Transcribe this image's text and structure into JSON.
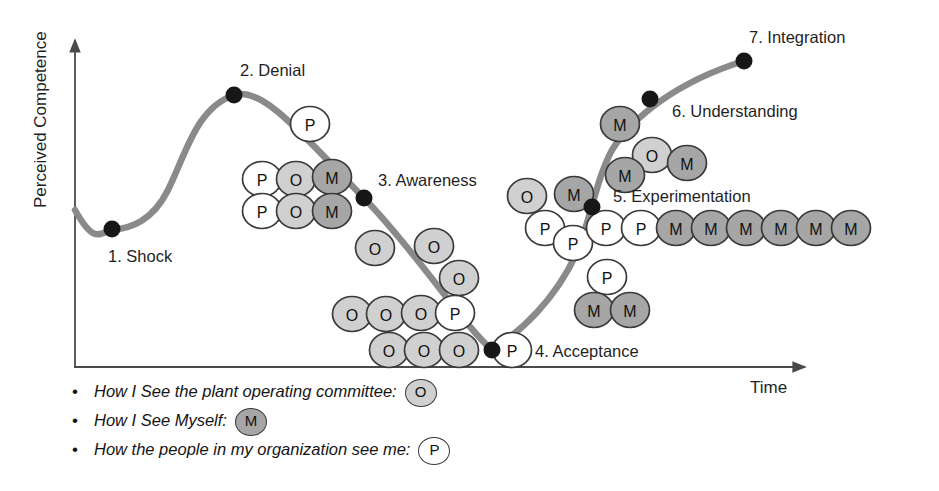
{
  "axes": {
    "y_label": "Perceived Competence",
    "x_label": "Time"
  },
  "stages": [
    {
      "id": 1,
      "label": "1. Shock",
      "dot": [
        112,
        229
      ],
      "text_x": 108,
      "text_y": 262,
      "anchor": "start"
    },
    {
      "id": 2,
      "label": "2. Denial",
      "dot": [
        234,
        95
      ],
      "text_x": 240,
      "text_y": 76,
      "anchor": "start"
    },
    {
      "id": 3,
      "label": "3. Awareness",
      "dot": [
        364,
        198
      ],
      "text_x": 378,
      "text_y": 186,
      "anchor": "start"
    },
    {
      "id": 4,
      "label": "4. Acceptance",
      "dot": [
        492,
        350
      ],
      "text_x": 535,
      "text_y": 357,
      "anchor": "start"
    },
    {
      "id": 5,
      "label": "5. Experimentation",
      "dot": [
        592,
        207
      ],
      "text_x": 613,
      "text_y": 202,
      "anchor": "start"
    },
    {
      "id": 6,
      "label": "6. Understanding",
      "dot": [
        650,
        99
      ],
      "text_x": 672,
      "text_y": 117,
      "anchor": "start"
    },
    {
      "id": 7,
      "label": "7. Integration",
      "dot": [
        744,
        61
      ],
      "text_x": 749,
      "text_y": 43,
      "anchor": "start"
    }
  ],
  "legend": [
    {
      "bullet": "•",
      "text": "How I See the plant operating committee:",
      "token": "O"
    },
    {
      "bullet": "•",
      "text": "How I See Myself:",
      "token": "M"
    },
    {
      "bullet": "•",
      "text": "How the people in my organization see me:",
      "token": "P"
    }
  ],
  "colors": {
    "curve": "#8a8a8a",
    "axis": "#4a4a4a",
    "dot": "#171717",
    "token_O_fill": "#d0d0d0",
    "token_M_fill": "#a6a6a6",
    "token_P_fill": "#ffffff",
    "token_stroke": "#3a3a3a",
    "text": "#1f1f1f"
  },
  "chart_data": {
    "type": "line",
    "title": "",
    "xlabel": "Time",
    "ylabel": "Perceived Competence",
    "grid": false,
    "legend_position": "below-left",
    "curve_path": "M 75 210 C 95 246, 100 232, 113 230 C 130 228, 152 222, 168 190 C 186 154, 196 108, 234 95 C 262 86, 300 132, 364 198 C 420 256, 462 324, 492 350 C 520 332, 556 300, 578 250 C 592 214, 596 180, 612 150 C 632 118, 676 82, 744 61",
    "stage_points": [
      {
        "stage": 1,
        "name": "Shock",
        "x_px": 112,
        "y_px": 229
      },
      {
        "stage": 2,
        "name": "Denial",
        "x_px": 234,
        "y_px": 95
      },
      {
        "stage": 3,
        "name": "Awareness",
        "x_px": 364,
        "y_px": 198
      },
      {
        "stage": 4,
        "name": "Acceptance",
        "x_px": 492,
        "y_px": 350
      },
      {
        "stage": 5,
        "name": "Experimentation",
        "x_px": 592,
        "y_px": 207
      },
      {
        "stage": 6,
        "name": "Understanding",
        "x_px": 650,
        "y_px": 99
      },
      {
        "stage": 7,
        "name": "Integration",
        "x_px": 744,
        "y_px": 61
      }
    ],
    "tokens": [
      {
        "t": "P",
        "x": 310,
        "y": 124
      },
      {
        "t": "P",
        "x": 262,
        "y": 179
      },
      {
        "t": "O",
        "x": 296,
        "y": 179
      },
      {
        "t": "M",
        "x": 332,
        "y": 177
      },
      {
        "t": "P",
        "x": 262,
        "y": 211
      },
      {
        "t": "O",
        "x": 296,
        "y": 211
      },
      {
        "t": "M",
        "x": 332,
        "y": 211
      },
      {
        "t": "O",
        "x": 375,
        "y": 248
      },
      {
        "t": "O",
        "x": 434,
        "y": 246
      },
      {
        "t": "O",
        "x": 459,
        "y": 278
      },
      {
        "t": "O",
        "x": 352,
        "y": 314
      },
      {
        "t": "O",
        "x": 386,
        "y": 314
      },
      {
        "t": "O",
        "x": 421,
        "y": 313
      },
      {
        "t": "P",
        "x": 455,
        "y": 313
      },
      {
        "t": "O",
        "x": 389,
        "y": 350
      },
      {
        "t": "O",
        "x": 424,
        "y": 350
      },
      {
        "t": "O",
        "x": 459,
        "y": 350
      },
      {
        "t": "P",
        "x": 512,
        "y": 350
      },
      {
        "t": "M",
        "x": 620,
        "y": 124
      },
      {
        "t": "O",
        "x": 652,
        "y": 155
      },
      {
        "t": "M",
        "x": 625,
        "y": 175
      },
      {
        "t": "M",
        "x": 687,
        "y": 163
      },
      {
        "t": "O",
        "x": 527,
        "y": 196
      },
      {
        "t": "M",
        "x": 574,
        "y": 194
      },
      {
        "t": "P",
        "x": 545,
        "y": 228
      },
      {
        "t": "P",
        "x": 573,
        "y": 243
      },
      {
        "t": "P",
        "x": 606,
        "y": 228
      },
      {
        "t": "P",
        "x": 641,
        "y": 228
      },
      {
        "t": "M",
        "x": 676,
        "y": 228
      },
      {
        "t": "M",
        "x": 711,
        "y": 228
      },
      {
        "t": "M",
        "x": 746,
        "y": 228
      },
      {
        "t": "M",
        "x": 781,
        "y": 228
      },
      {
        "t": "M",
        "x": 816,
        "y": 228
      },
      {
        "t": "M",
        "x": 851,
        "y": 228
      },
      {
        "t": "P",
        "x": 607,
        "y": 277
      },
      {
        "t": "M",
        "x": 594,
        "y": 310
      },
      {
        "t": "M",
        "x": 630,
        "y": 310
      }
    ]
  }
}
